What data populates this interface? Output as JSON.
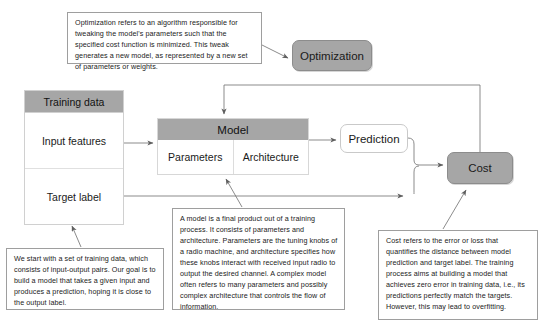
{
  "diagram": {
    "colors": {
      "node_fill": "#a6a6a6",
      "node_border": "#8c8c8c",
      "white_fill": "#ffffff",
      "note_border": "#9e9e9e",
      "wire": "#6e6e6e",
      "text": "#1a1a1a"
    }
  },
  "nodes": {
    "training_data": {
      "header": "Training data",
      "rows": [
        "Input features",
        "Target label"
      ]
    },
    "model": {
      "header": "Model",
      "columns": [
        "Parameters",
        "Architecture"
      ]
    },
    "prediction": {
      "label": "Prediction"
    },
    "optimization": {
      "label": "Optimization"
    },
    "cost": {
      "label": "Cost"
    }
  },
  "notes": {
    "optimization": {
      "text": "Optimization refers to an algorithm responsible for tweaking the model's parameters such that the specified cost function is minimized. This tweak generates a new model, as represented by a new set of parameters or weights."
    },
    "training": {
      "text": "We start with a set of training data, which consists of input-output pairs. Our goal is to build a model that takes a given input and produces a prediction, hoping it is close to the output label."
    },
    "model": {
      "text": "A model is a final product out of a training process. It consists of parameters and architecture. Parameters are the tuning knobs of a radio machine, and architecture specifies how these knobs interact with received input radio to output the desired channel. A complex model often refers to many parameters and possibly complex architecture that controls the flow of information."
    },
    "cost": {
      "text": "Cost refers to the error or loss that quantifies the distance between model prediction and target label. The training process aims at building a model that achieves zero error in training data, i.e., its predictions perfectly match the targets. However, this may lead to overfitting."
    }
  },
  "connections": [
    {
      "name": "input-features-to-model",
      "from": "Input features",
      "to": "Model",
      "style": "arrow"
    },
    {
      "name": "model-to-prediction",
      "from": "Model",
      "to": "Prediction",
      "style": "arrow"
    },
    {
      "name": "prediction-to-cost",
      "from": "Prediction",
      "to": "Cost",
      "style": "arrow"
    },
    {
      "name": "target-label-to-cost",
      "from": "Target label",
      "to": "Cost",
      "style": "arrow"
    },
    {
      "name": "cost-to-optimization",
      "from": "Cost",
      "to": "Optimization",
      "style": "line"
    },
    {
      "name": "optimization-to-model",
      "from": "Optimization",
      "to": "Model",
      "style": "arrow"
    },
    {
      "name": "note-optimization-leader",
      "from": "Optimization note",
      "to": "Optimization",
      "style": "leader"
    },
    {
      "name": "note-training-leader",
      "from": "Training note",
      "to": "Training data",
      "style": "leader"
    },
    {
      "name": "note-model-leader",
      "from": "Model note",
      "to": "Model",
      "style": "leader"
    },
    {
      "name": "note-cost-leader",
      "from": "Cost note",
      "to": "Cost",
      "style": "leader"
    }
  ]
}
